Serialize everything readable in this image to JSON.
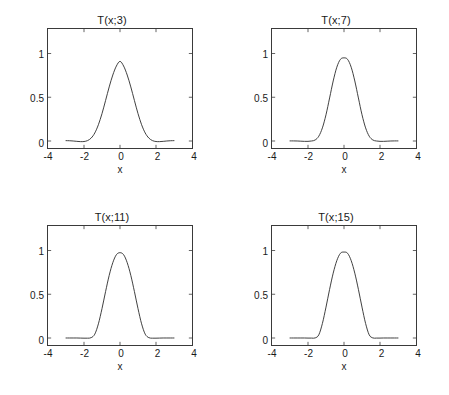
{
  "figure": {
    "background_color": "#ffffff",
    "axis_color": "#3a3a3a",
    "curve_color": "#2b2b2b",
    "text_color": "#1a1a1a"
  },
  "panels": [
    {
      "title": "T(x;3)",
      "xlabel": "x",
      "xticklabels": [
        "-4",
        "-2",
        "0",
        "2",
        "4"
      ],
      "yticklabels": [
        "0",
        "0.5",
        "1"
      ]
    },
    {
      "title": "T(x;7)",
      "xlabel": "x",
      "xticklabels": [
        "-4",
        "-2",
        "0",
        "2",
        "4"
      ],
      "yticklabels": [
        "0",
        "0.5",
        "1"
      ]
    },
    {
      "title": "T(x;11)",
      "xlabel": "x",
      "xticklabels": [
        "-4",
        "-2",
        "0",
        "2",
        "4"
      ],
      "yticklabels": [
        "0",
        "0.5",
        "1"
      ]
    },
    {
      "title": "T(x;15)",
      "xlabel": "x",
      "xticklabels": [
        "-4",
        "-2",
        "0",
        "2",
        "4"
      ],
      "yticklabels": [
        "0",
        "0.5",
        "1"
      ]
    }
  ],
  "chart_data": [
    {
      "type": "line",
      "title": "T(x;3)",
      "xlabel": "x",
      "ylabel": "",
      "xlim": [
        -4,
        4
      ],
      "ylim": [
        -0.08,
        1.28
      ],
      "xticks": [
        -4,
        -2,
        0,
        2,
        4
      ],
      "yticks": [
        0,
        0.5,
        1
      ],
      "grid": false,
      "legend": null,
      "series": [
        {
          "name": "T(x;3)",
          "x": [
            -3.0,
            -2.8,
            -2.6,
            -2.4,
            -2.2,
            -2.0,
            -1.8,
            -1.6,
            -1.4,
            -1.2,
            -1.0,
            -0.8,
            -0.6,
            -0.4,
            -0.2,
            0.0,
            0.2,
            0.4,
            0.6,
            0.8,
            1.0,
            1.2,
            1.4,
            1.6,
            1.8,
            2.0,
            2.2,
            2.4,
            2.6,
            2.8,
            3.0
          ],
          "y": [
            0.004,
            0.003,
            0.0,
            -0.004,
            -0.007,
            -0.006,
            0.005,
            0.034,
            0.092,
            0.186,
            0.313,
            0.464,
            0.618,
            0.754,
            0.857,
            0.91,
            0.857,
            0.754,
            0.618,
            0.464,
            0.313,
            0.186,
            0.092,
            0.034,
            0.005,
            -0.006,
            -0.007,
            -0.004,
            0.0,
            0.003,
            0.004
          ]
        }
      ]
    },
    {
      "type": "line",
      "title": "T(x;7)",
      "xlabel": "x",
      "ylabel": "",
      "xlim": [
        -4,
        4
      ],
      "ylim": [
        -0.08,
        1.28
      ],
      "xticks": [
        -4,
        -2,
        0,
        2,
        4
      ],
      "yticks": [
        0,
        0.5,
        1
      ],
      "grid": false,
      "legend": null,
      "series": [
        {
          "name": "T(x;7)",
          "x": [
            -3.0,
            -2.8,
            -2.6,
            -2.4,
            -2.2,
            -2.0,
            -1.8,
            -1.6,
            -1.4,
            -1.2,
            -1.0,
            -0.8,
            -0.6,
            -0.4,
            -0.2,
            0.0,
            0.2,
            0.4,
            0.6,
            0.8,
            1.0,
            1.2,
            1.4,
            1.6,
            1.8,
            2.0,
            2.2,
            2.4,
            2.6,
            2.8,
            3.0
          ],
          "y": [
            0.001,
            0.001,
            0.0,
            -0.002,
            -0.004,
            -0.004,
            0.0,
            0.012,
            0.055,
            0.15,
            0.3,
            0.492,
            0.686,
            0.843,
            0.933,
            0.95,
            0.933,
            0.843,
            0.686,
            0.492,
            0.3,
            0.15,
            0.055,
            0.012,
            0.0,
            -0.004,
            -0.004,
            -0.002,
            0.0,
            0.001,
            0.001
          ]
        }
      ]
    },
    {
      "type": "line",
      "title": "T(x;11)",
      "xlabel": "x",
      "ylabel": "",
      "xlim": [
        -4,
        4
      ],
      "ylim": [
        -0.08,
        1.28
      ],
      "xticks": [
        -4,
        -2,
        0,
        2,
        4
      ],
      "yticks": [
        0,
        0.5,
        1
      ],
      "grid": false,
      "legend": null,
      "series": [
        {
          "name": "T(x;11)",
          "x": [
            -3.0,
            -2.8,
            -2.6,
            -2.4,
            -2.2,
            -2.0,
            -1.8,
            -1.6,
            -1.4,
            -1.2,
            -1.0,
            -0.8,
            -0.6,
            -0.4,
            -0.2,
            0.0,
            0.2,
            0.4,
            0.6,
            0.8,
            1.0,
            1.2,
            1.4,
            1.6,
            1.8,
            2.0,
            2.2,
            2.4,
            2.6,
            2.8,
            3.0
          ],
          "y": [
            0.0,
            0.0,
            0.0,
            0.0,
            -0.001,
            -0.002,
            -0.002,
            0.004,
            0.044,
            0.162,
            0.336,
            0.532,
            0.716,
            0.861,
            0.952,
            0.975,
            0.952,
            0.861,
            0.716,
            0.532,
            0.336,
            0.162,
            0.044,
            0.004,
            -0.002,
            -0.002,
            -0.001,
            0.0,
            0.0,
            0.0,
            0.0
          ]
        }
      ]
    },
    {
      "type": "line",
      "title": "T(x;15)",
      "xlabel": "x",
      "ylabel": "",
      "xlim": [
        -4,
        4
      ],
      "ylim": [
        -0.08,
        1.28
      ],
      "xticks": [
        -4,
        -2,
        0,
        2,
        4
      ],
      "yticks": [
        0,
        0.5,
        1
      ],
      "grid": false,
      "legend": null,
      "series": [
        {
          "name": "T(x;15)",
          "x": [
            -3.0,
            -2.8,
            -2.6,
            -2.4,
            -2.2,
            -2.0,
            -1.8,
            -1.6,
            -1.4,
            -1.2,
            -1.0,
            -0.8,
            -0.6,
            -0.4,
            -0.2,
            0.0,
            0.2,
            0.4,
            0.6,
            0.8,
            1.0,
            1.2,
            1.4,
            1.6,
            1.8,
            2.0,
            2.2,
            2.4,
            2.6,
            2.8,
            3.0
          ],
          "y": [
            0.0,
            0.0,
            0.0,
            0.0,
            0.0,
            -0.001,
            -0.001,
            0.001,
            0.036,
            0.166,
            0.353,
            0.556,
            0.741,
            0.884,
            0.968,
            0.982,
            0.968,
            0.884,
            0.741,
            0.556,
            0.353,
            0.166,
            0.036,
            0.001,
            -0.001,
            -0.001,
            0.0,
            0.0,
            0.0,
            0.0,
            0.0
          ]
        }
      ]
    }
  ]
}
